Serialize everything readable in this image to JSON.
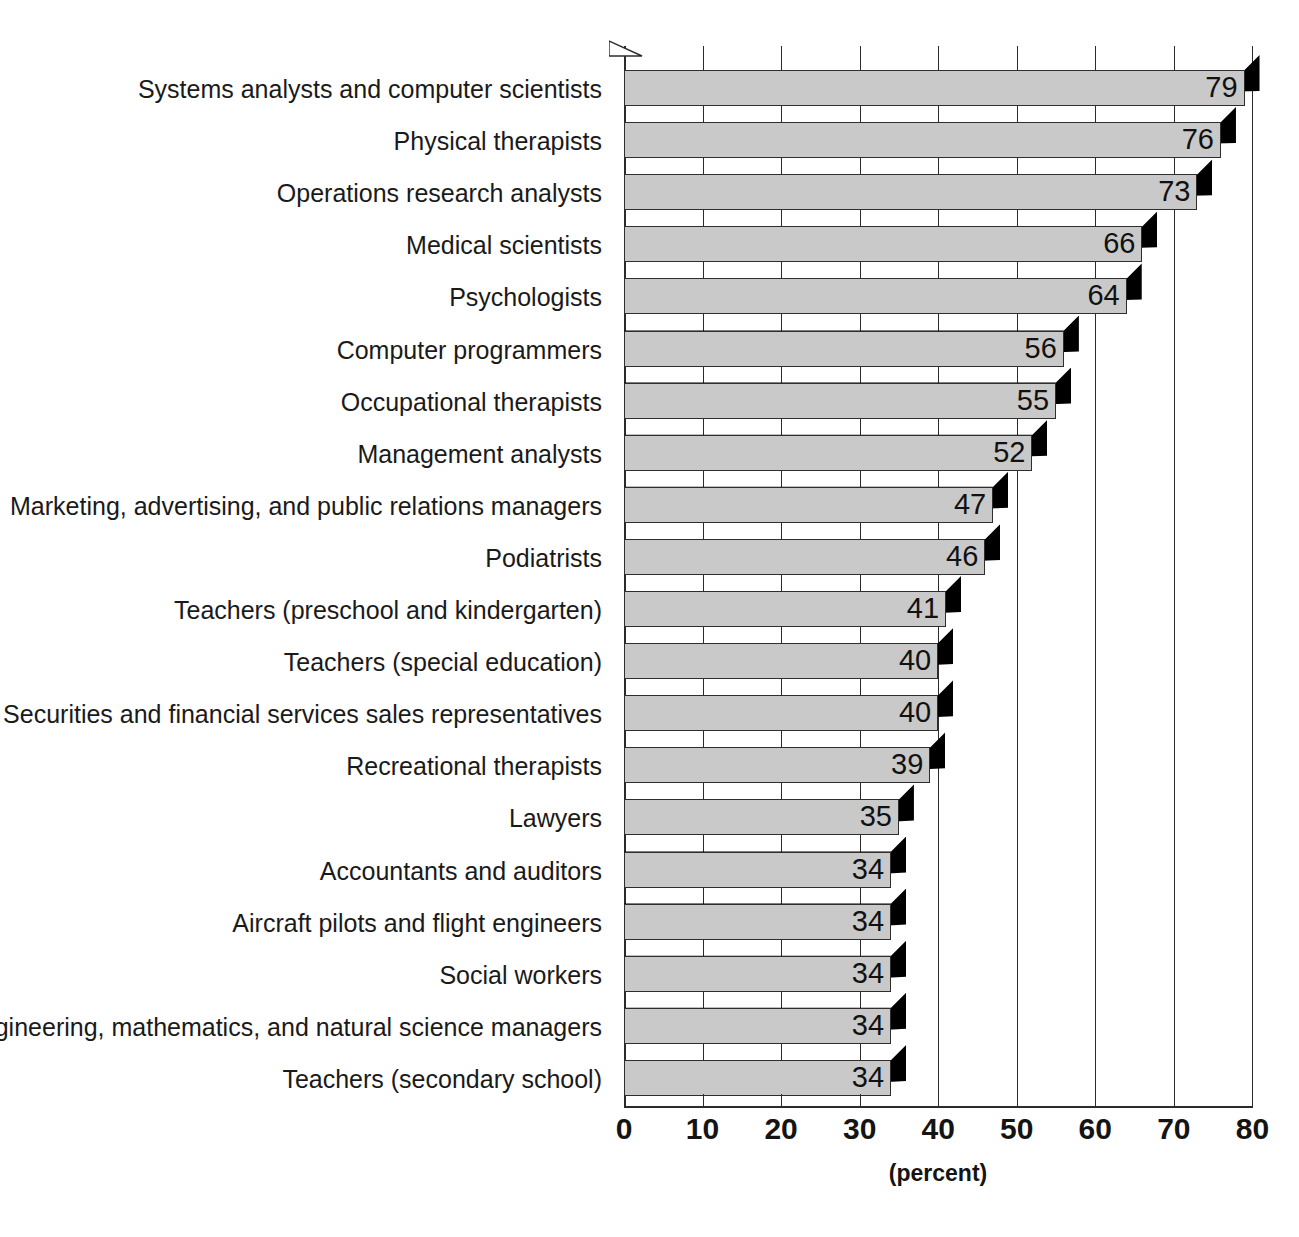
{
  "chart_data": {
    "type": "bar",
    "orientation": "horizontal",
    "title": "",
    "subtitle": "",
    "xlabel": "(percent)",
    "ylabel": "",
    "xlim": [
      0,
      80
    ],
    "xticks": [
      0,
      10,
      20,
      30,
      40,
      50,
      60,
      70,
      80
    ],
    "xtick_labels": [
      "0",
      "10",
      "20",
      "30",
      "40",
      "50",
      "60",
      "70",
      "80"
    ],
    "grid": "vertical",
    "legend": null,
    "value_label_format": "integer-inside-bar-right",
    "categories": [
      "Systems analysts and computer scientists",
      "Physical therapists",
      "Operations research analysts",
      "Medical scientists",
      "Psychologists",
      "Computer programmers",
      "Occupational therapists",
      "Management analysts",
      "Marketing, advertising, and public relations managers",
      "Podiatrists",
      "Teachers (preschool and kindergarten)",
      "Teachers (special education)",
      "Securities and financial services sales representatives",
      "Recreational therapists",
      "Lawyers",
      "Accountants and auditors",
      "Aircraft pilots and flight engineers",
      "Social workers",
      "Engineering, mathematics, and natural science managers",
      "Teachers (secondary school)"
    ],
    "values": [
      79,
      76,
      73,
      66,
      64,
      56,
      55,
      52,
      47,
      46,
      41,
      40,
      40,
      39,
      35,
      34,
      34,
      34,
      34,
      34
    ],
    "value_labels": [
      "79",
      "76",
      "73",
      "66",
      "64",
      "56",
      "55",
      "52",
      "47",
      "46",
      "41",
      "40",
      "40",
      "39",
      "35",
      "34",
      "34",
      "34",
      "34",
      "34"
    ]
  },
  "style": {
    "bar_face_color": "#c9c9c9",
    "bar_shadow_color": "#000000",
    "outline_color": "#2e2e2e",
    "grid_color": "#2b2b2b",
    "background": "#ffffff",
    "text_color": "#1a1a1a"
  }
}
